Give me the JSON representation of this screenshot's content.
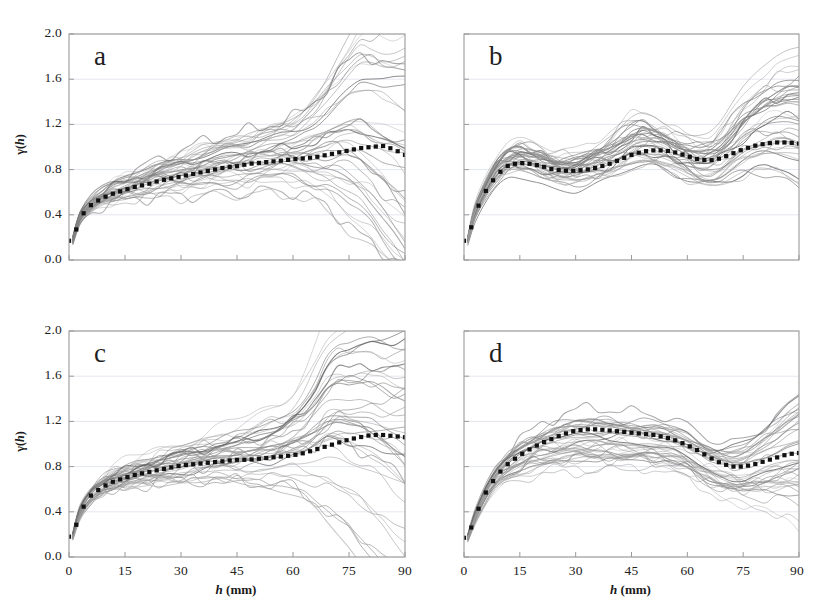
{
  "figure": {
    "width": 829,
    "height": 610,
    "background": "#ffffff",
    "panel_letters": [
      "a",
      "b",
      "c",
      "d"
    ]
  },
  "axes": {
    "y_label": "γ(h)",
    "y_label_symbol": "γ(",
    "y_label_italic": "h",
    "y_label_close": ")",
    "x_label_italic": "h",
    "x_label_rest": " (mm)",
    "x_label_full": "h (mm)",
    "y_ticks": [
      "0.0",
      "0.4",
      "0.8",
      "1.2",
      "1.6",
      "2.0"
    ],
    "x_ticks": [
      "0",
      "15",
      "30",
      "45",
      "60",
      "75",
      "90"
    ],
    "x_ticks_d": [
      "0",
      "15",
      "30",
      "45",
      "60",
      "75",
      "90"
    ],
    "ylim": [
      0.0,
      2.0
    ],
    "xlim": [
      0,
      90
    ],
    "grid": "horizontal-light",
    "frame_color": "#9a9a9a",
    "grid_color": "#d8dce8",
    "ensemble_color": "#7e7e7e",
    "mean_color": "#111111"
  },
  "chart_data": {
    "type": "line",
    "title": "",
    "subtitle": "",
    "xlabel": "h (mm)",
    "ylabel": "γ(h)",
    "xlim": [
      0,
      90
    ],
    "ylim": [
      0,
      2.0
    ],
    "x_ticks": [
      0,
      15,
      30,
      45,
      60,
      75,
      90
    ],
    "y_ticks": [
      0.0,
      0.4,
      0.8,
      1.2,
      1.6,
      2.0
    ],
    "grid": "horizontal",
    "legend": "none",
    "n_ensemble_curves": 40,
    "panels": [
      {
        "letter": "a",
        "description": "Monotonic rising variogram reaching a plateau near 0.9-1.0, with strong divergence of individual curves beyond h=70 mm; several curves peak near 1.95 around h=80 mm and others fall to 0.4.",
        "x": [
          1,
          3,
          6,
          9,
          12,
          15,
          18,
          21,
          24,
          27,
          30,
          33,
          36,
          39,
          42,
          45,
          48,
          51,
          54,
          57,
          60,
          63,
          66,
          69,
          72,
          75,
          78,
          81,
          84,
          87,
          90
        ],
        "mean_values": [
          0.17,
          0.38,
          0.49,
          0.55,
          0.59,
          0.62,
          0.65,
          0.67,
          0.7,
          0.72,
          0.74,
          0.76,
          0.78,
          0.8,
          0.82,
          0.83,
          0.85,
          0.86,
          0.87,
          0.88,
          0.89,
          0.9,
          0.91,
          0.93,
          0.95,
          0.97,
          0.99,
          1.0,
          1.01,
          0.98,
          0.93
        ],
        "ensemble_spread_lower": [
          0.14,
          0.33,
          0.43,
          0.48,
          0.52,
          0.55,
          0.57,
          0.59,
          0.6,
          0.61,
          0.62,
          0.63,
          0.64,
          0.65,
          0.66,
          0.66,
          0.67,
          0.68,
          0.68,
          0.68,
          0.67,
          0.66,
          0.64,
          0.62,
          0.58,
          0.53,
          0.48,
          0.44,
          0.42,
          0.41,
          0.4
        ],
        "ensemble_spread_upper": [
          0.21,
          0.44,
          0.57,
          0.64,
          0.7,
          0.74,
          0.79,
          0.84,
          0.89,
          0.93,
          0.97,
          1.01,
          1.05,
          1.08,
          1.11,
          1.14,
          1.17,
          1.2,
          1.24,
          1.28,
          1.33,
          1.4,
          1.5,
          1.62,
          1.76,
          1.88,
          1.95,
          1.9,
          1.8,
          1.72,
          1.65
        ]
      },
      {
        "letter": "b",
        "description": "Oscillating (hole-effect) variogram: rapid rise to ~0.9 by h=12 mm, dip near h=25 mm, secondary peak near h=45 mm, dip near h=62 mm, rise again toward h=90 mm; mean settles around 1.02.",
        "x": [
          1,
          3,
          6,
          9,
          12,
          15,
          18,
          21,
          24,
          27,
          30,
          33,
          36,
          39,
          42,
          45,
          48,
          51,
          54,
          57,
          60,
          63,
          66,
          69,
          72,
          75,
          78,
          81,
          84,
          87,
          90
        ],
        "mean_values": [
          0.17,
          0.42,
          0.62,
          0.76,
          0.84,
          0.86,
          0.85,
          0.83,
          0.8,
          0.79,
          0.79,
          0.8,
          0.82,
          0.85,
          0.89,
          0.93,
          0.96,
          0.97,
          0.97,
          0.95,
          0.92,
          0.89,
          0.88,
          0.9,
          0.94,
          0.98,
          1.01,
          1.03,
          1.04,
          1.04,
          1.03
        ],
        "ensemble_spread_lower": [
          0.14,
          0.36,
          0.54,
          0.66,
          0.73,
          0.74,
          0.72,
          0.69,
          0.66,
          0.65,
          0.64,
          0.65,
          0.66,
          0.68,
          0.71,
          0.74,
          0.76,
          0.77,
          0.76,
          0.72,
          0.67,
          0.62,
          0.6,
          0.62,
          0.68,
          0.74,
          0.79,
          0.83,
          0.86,
          0.87,
          0.86
        ],
        "ensemble_spread_upper": [
          0.21,
          0.5,
          0.74,
          0.92,
          1.02,
          1.04,
          1.02,
          0.99,
          0.96,
          0.95,
          0.96,
          0.99,
          1.04,
          1.1,
          1.18,
          1.26,
          1.28,
          1.25,
          1.2,
          1.14,
          1.09,
          1.07,
          1.09,
          1.16,
          1.27,
          1.38,
          1.47,
          1.53,
          1.56,
          1.56,
          1.54
        ]
      },
      {
        "letter": "c",
        "description": "Monotonic rising variogram similar to panel a but with a steeper unbounded trend: mean climbs from 0.18 to about 1.08; several individual curves shoot past 2.0 beyond h=70 mm while others drop toward 0.4.",
        "x": [
          1,
          3,
          6,
          9,
          12,
          15,
          18,
          21,
          24,
          27,
          30,
          33,
          36,
          39,
          42,
          45,
          48,
          51,
          54,
          57,
          60,
          63,
          66,
          69,
          72,
          75,
          78,
          81,
          84,
          87,
          90
        ],
        "mean_values": [
          0.18,
          0.4,
          0.55,
          0.62,
          0.67,
          0.7,
          0.73,
          0.75,
          0.77,
          0.79,
          0.81,
          0.82,
          0.83,
          0.84,
          0.85,
          0.86,
          0.86,
          0.87,
          0.88,
          0.89,
          0.9,
          0.92,
          0.95,
          0.98,
          1.01,
          1.04,
          1.06,
          1.08,
          1.08,
          1.07,
          1.06
        ],
        "ensemble_spread_lower": [
          0.15,
          0.34,
          0.48,
          0.55,
          0.59,
          0.61,
          0.63,
          0.64,
          0.65,
          0.66,
          0.67,
          0.68,
          0.68,
          0.68,
          0.68,
          0.68,
          0.68,
          0.67,
          0.66,
          0.65,
          0.63,
          0.6,
          0.57,
          0.54,
          0.51,
          0.48,
          0.46,
          0.45,
          0.44,
          0.43,
          0.42
        ],
        "ensemble_spread_upper": [
          0.22,
          0.47,
          0.63,
          0.71,
          0.77,
          0.81,
          0.85,
          0.89,
          0.93,
          0.96,
          1.0,
          1.03,
          1.06,
          1.09,
          1.12,
          1.15,
          1.18,
          1.22,
          1.27,
          1.33,
          1.42,
          1.55,
          1.72,
          1.92,
          2.0,
          2.0,
          2.0,
          1.95,
          1.85,
          1.75,
          1.68
        ]
      },
      {
        "letter": "d",
        "description": "Strong hole-effect variogram: rises steeply to a broad maximum of about 1.13 near h=35-45 mm, falls to a trough of about 0.80 near h=72 mm, then rises again to about 0.92 at h=90 mm.",
        "x": [
          1,
          3,
          6,
          9,
          12,
          15,
          18,
          21,
          24,
          27,
          30,
          33,
          36,
          39,
          42,
          45,
          48,
          51,
          54,
          57,
          60,
          63,
          66,
          69,
          72,
          75,
          78,
          81,
          84,
          87,
          90
        ],
        "mean_values": [
          0.17,
          0.36,
          0.58,
          0.73,
          0.83,
          0.9,
          0.96,
          1.01,
          1.05,
          1.09,
          1.12,
          1.13,
          1.13,
          1.12,
          1.11,
          1.1,
          1.09,
          1.08,
          1.06,
          1.03,
          0.99,
          0.94,
          0.88,
          0.83,
          0.8,
          0.8,
          0.82,
          0.85,
          0.88,
          0.91,
          0.92
        ],
        "ensemble_spread_lower": [
          0.14,
          0.31,
          0.5,
          0.63,
          0.7,
          0.74,
          0.77,
          0.79,
          0.8,
          0.81,
          0.82,
          0.82,
          0.82,
          0.82,
          0.82,
          0.82,
          0.82,
          0.81,
          0.79,
          0.76,
          0.72,
          0.67,
          0.62,
          0.58,
          0.56,
          0.56,
          0.58,
          0.6,
          0.62,
          0.64,
          0.65
        ],
        "ensemble_spread_upper": [
          0.21,
          0.42,
          0.67,
          0.84,
          0.96,
          1.05,
          1.12,
          1.18,
          1.23,
          1.27,
          1.3,
          1.31,
          1.31,
          1.3,
          1.29,
          1.28,
          1.27,
          1.26,
          1.24,
          1.21,
          1.17,
          1.12,
          1.07,
          1.03,
          1.01,
          1.02,
          1.06,
          1.12,
          1.19,
          1.26,
          1.31
        ]
      }
    ]
  }
}
